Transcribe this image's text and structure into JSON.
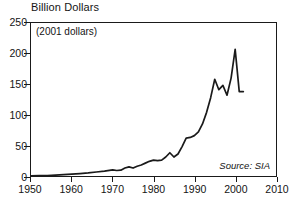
{
  "chart_data": {
    "type": "line",
    "title": "Billion Dollars",
    "subtitle": "(2001 dollars)",
    "annotation": "Source: SIA",
    "xlabel": "",
    "ylabel": "",
    "xlim": [
      1950,
      2010
    ],
    "ylim": [
      0,
      250
    ],
    "grid": false,
    "legend": null,
    "line_color": "#1a1a1a",
    "frame_color": "#1a1a1a",
    "background": "#ffffff",
    "x_ticks": [
      1950,
      1960,
      1970,
      1980,
      1990,
      2000,
      2010
    ],
    "x_tick_labels": [
      "1950",
      "1960",
      "1970",
      "1980",
      "1990",
      "2000",
      "2010"
    ],
    "y_ticks": [
      0,
      50,
      100,
      150,
      200,
      250
    ],
    "y_tick_labels": [
      "0",
      "50",
      "100",
      "150",
      "200",
      "250"
    ],
    "series": [
      {
        "name": "Worldwide semiconductor sales",
        "x": [
          1950,
          1952,
          1954,
          1956,
          1958,
          1960,
          1962,
          1964,
          1966,
          1968,
          1970,
          1971,
          1972,
          1973,
          1974,
          1975,
          1976,
          1977,
          1978,
          1979,
          1980,
          1981,
          1982,
          1983,
          1984,
          1985,
          1986,
          1987,
          1988,
          1989,
          1990,
          1991,
          1992,
          1993,
          1994,
          1995,
          1996,
          1997,
          1998,
          1999,
          2000,
          2001,
          2002
        ],
        "values": [
          0.3,
          0.5,
          0.8,
          1.5,
          2.2,
          3.0,
          4.0,
          5.0,
          6.5,
          8.0,
          10.0,
          9.0,
          9.5,
          13.0,
          15.0,
          13.0,
          16.0,
          18.0,
          21.0,
          24.0,
          26.0,
          25.0,
          26.0,
          31.0,
          38.0,
          31.0,
          36.0,
          48.0,
          62.0,
          63.0,
          66.0,
          72.0,
          85.0,
          104.0,
          128.0,
          158.0,
          141.0,
          148.0,
          132.0,
          160.0,
          207.0,
          138.0,
          138.0
        ]
      }
    ]
  }
}
